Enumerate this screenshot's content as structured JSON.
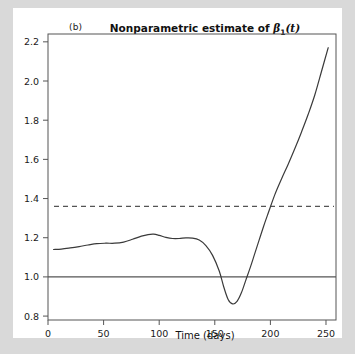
{
  "figure": {
    "panel_label": "(b)",
    "title_prefix": "Nonparametric estimate of ",
    "title_symbol": "β",
    "title_subscript": "1",
    "title_suffix": "(t)",
    "title_plain": "Nonparametric estimate of β₁ (t)",
    "background_color": "#d9d9d9",
    "page_color": "#ffffff",
    "line_color": "#3a3a3a",
    "axis_color": "#555555"
  },
  "chart_data": {
    "type": "line",
    "xlabel": "Time (days)",
    "ylabel": "",
    "xlim": [
      0,
      259
    ],
    "ylim": [
      0.78,
      2.24
    ],
    "xticks": [
      0,
      50,
      100,
      150,
      200,
      250
    ],
    "xticklabels": [
      "0",
      "50",
      "100",
      "150",
      "200",
      "250"
    ],
    "yticks": [
      0.8,
      1.0,
      1.2,
      1.4,
      1.6,
      1.8,
      2.0,
      2.2
    ],
    "yticklabels": [
      "0.8",
      "1.0",
      "1.2",
      "1.4",
      "1.6",
      "1.8",
      "2.0",
      "2.2"
    ],
    "grid": false,
    "legend": "none",
    "reference_lines": [
      {
        "name": "solid-reference-line",
        "y": 1.0,
        "style": "solid"
      },
      {
        "name": "dashed-reference-line",
        "y": 1.36,
        "style": "dashed"
      }
    ],
    "series": [
      {
        "name": "beta1-estimate",
        "style": "solid",
        "x": [
          5,
          12,
          20,
          28,
          36,
          44,
          52,
          60,
          68,
          76,
          84,
          90,
          95,
          100,
          106,
          112,
          118,
          124,
          130,
          136,
          142,
          148,
          154,
          158,
          162,
          166,
          170,
          174,
          178,
          182,
          186,
          190,
          194,
          198,
          204,
          210,
          216,
          222,
          228,
          234,
          240,
          246,
          252
        ],
        "y": [
          1.14,
          1.142,
          1.148,
          1.155,
          1.163,
          1.17,
          1.172,
          1.172,
          1.178,
          1.192,
          1.208,
          1.216,
          1.218,
          1.212,
          1.202,
          1.196,
          1.196,
          1.199,
          1.198,
          1.188,
          1.16,
          1.11,
          1.03,
          0.95,
          0.885,
          0.862,
          0.875,
          0.92,
          0.985,
          1.05,
          1.12,
          1.19,
          1.26,
          1.325,
          1.42,
          1.5,
          1.575,
          1.655,
          1.74,
          1.83,
          1.93,
          2.05,
          2.17
        ]
      }
    ],
    "annotations": [
      {
        "name": "crossing-dashed-line",
        "x": 197,
        "y": 1.36
      },
      {
        "name": "curve-minimum",
        "x": 163,
        "y": 0.86
      },
      {
        "name": "curve-local-max",
        "x": 95,
        "y": 1.22
      }
    ]
  }
}
